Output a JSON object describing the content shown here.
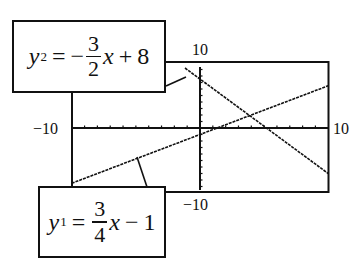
{
  "chart_data": {
    "type": "line",
    "title": "",
    "window": {
      "xmin": -10,
      "xmax": 10,
      "ymin": -10,
      "ymax": 10
    },
    "axis_labels": {
      "xmin": "−10",
      "xmax": "10",
      "ymin": "−10",
      "ymax": "10"
    },
    "series": [
      {
        "name": "y1",
        "equation": "y1 = 3/4 x − 1",
        "slope": 0.75,
        "intercept": -1,
        "points": [
          [
            -10,
            -8.5
          ],
          [
            10,
            6.5
          ]
        ]
      },
      {
        "name": "y2",
        "equation": "y2 = −3/2 x + 8",
        "slope": -1.5,
        "intercept": 8,
        "points": [
          [
            -1.333,
            10
          ],
          [
            10,
            -7
          ]
        ]
      }
    ],
    "intersection": {
      "x": 4,
      "y": 2
    },
    "grid": false,
    "ticks": "every 1 unit on both axes"
  },
  "labels": {
    "ymax": "10",
    "ymin": "−10",
    "xmin": "−10",
    "xmax": "10"
  },
  "callouts": {
    "y2": {
      "var": "y",
      "sub": "2",
      "eq": "=",
      "sign": "−",
      "num": "3",
      "den": "2",
      "x": "x",
      "op": "+",
      "const": "8"
    },
    "y1": {
      "var": "y",
      "sub": "1",
      "eq": "=",
      "sign": "",
      "num": "3",
      "den": "4",
      "x": "x",
      "op": "−",
      "const": "1"
    }
  },
  "colors": {
    "ink": "#111111",
    "background": "#ffffff"
  }
}
